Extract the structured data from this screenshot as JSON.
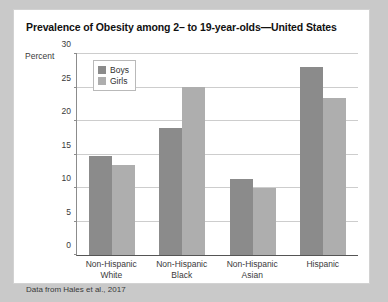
{
  "chart_data": {
    "type": "bar",
    "title": "Prevalence of Obesity among 2– to 19-year-olds—United States",
    "xlabel": "",
    "ylabel": "Percent",
    "categories": [
      "Non-Hispanic White",
      "Non-Hispanic Black",
      "Non-Hispanic Asian",
      "Hispanic"
    ],
    "series": [
      {
        "name": "Boys",
        "color": "#8b8b8b",
        "values": [
          14.8,
          19.0,
          11.4,
          28.0
        ]
      },
      {
        "name": "Girls",
        "color": "#aeaeae",
        "values": [
          13.5,
          25.1,
          10.0,
          23.5
        ]
      }
    ],
    "ylim": [
      0,
      30
    ],
    "yticks": [
      0,
      5,
      10,
      15,
      20,
      25,
      30
    ],
    "ytick_labels": [
      "0",
      "5",
      "10",
      "15",
      "20",
      "25",
      "30"
    ],
    "grid": true,
    "legend_position": "top-left",
    "source_note": "Data from Hales et al., 2017"
  },
  "category_lines": [
    [
      "Non-Hispanic",
      "White"
    ],
    [
      "Non-Hispanic",
      "Black"
    ],
    [
      "Non-Hispanic",
      "Asian"
    ],
    [
      "Hispanic",
      ""
    ]
  ]
}
